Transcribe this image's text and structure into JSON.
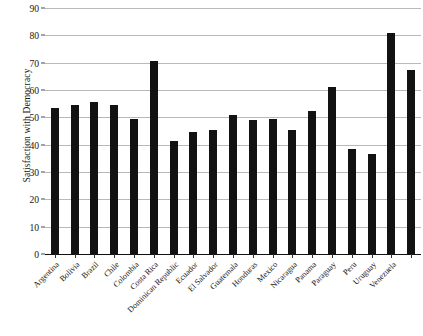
{
  "chart_data": {
    "type": "bar",
    "title": "",
    "subtitle": "",
    "xlabel": "",
    "ylabel": "Satisfaction with Democracy",
    "ylim": [
      0,
      90
    ],
    "yticks": [
      0,
      10,
      20,
      30,
      40,
      50,
      60,
      70,
      80,
      90
    ],
    "ytick_labels": [
      "0",
      "10",
      "20",
      "30",
      "40",
      "50",
      "60",
      "70",
      "80",
      "90"
    ],
    "grid": true,
    "legend": null,
    "bar_color": "#121212",
    "categories": [
      "Argentina",
      "Bolivia",
      "Brazil",
      "Chile",
      "Colombia",
      "Costa Rica",
      "Dominican Republic",
      "Ecuador",
      "El Salvador",
      "Guatemala",
      "Honduras",
      "Mexico",
      "Nicaragua",
      "Panama",
      "Paraguay",
      "Peru",
      "Uruguay",
      "Venezuela"
    ],
    "values": [
      53.5,
      54.5,
      55.5,
      54.5,
      49.5,
      70.5,
      41.5,
      44.5,
      45.5,
      51.0,
      49.0,
      49.5,
      45.5,
      52.5,
      61.0,
      38.5,
      36.5,
      81.0
    ],
    "extra_values": [
      67.5
    ]
  },
  "axis": {
    "y_title": "Satisfaction with Democracy"
  }
}
